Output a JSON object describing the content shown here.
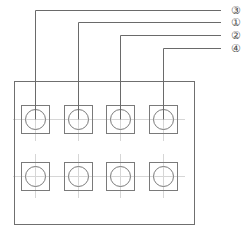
{
  "diagram": {
    "canvas": {
      "width": 249,
      "height": 232
    },
    "line_color": "#6f6f6f",
    "module_color": "#7a7a7a",
    "centerline_color": "#d6d6d6",
    "label_color": "#4a4a4a",
    "background_color": "#ffffff"
  },
  "enclosure": {
    "name": "outer housing panel",
    "x": 14,
    "y": 81,
    "width": 180,
    "height": 143
  },
  "modules": {
    "rows": 2,
    "columns": 4,
    "square_size": 28,
    "circle_diameter": 20,
    "column_pitch": 43,
    "row_pitch": 57,
    "first_column_x": 21,
    "row_y": [
      105,
      162
    ],
    "items": [
      {
        "row": 1,
        "column": 1,
        "cx": 35,
        "cy": 119
      },
      {
        "row": 1,
        "column": 2,
        "cx": 78,
        "cy": 119
      },
      {
        "row": 1,
        "column": 3,
        "cx": 120,
        "cy": 119
      },
      {
        "row": 1,
        "column": 4,
        "cx": 163,
        "cy": 119
      },
      {
        "row": 2,
        "column": 1,
        "cx": 35,
        "cy": 176
      },
      {
        "row": 2,
        "column": 2,
        "cx": 78,
        "cy": 176
      },
      {
        "row": 2,
        "column": 3,
        "cx": 120,
        "cy": 176
      },
      {
        "row": 2,
        "column": 4,
        "cx": 163,
        "cy": 176
      }
    ]
  },
  "callouts": [
    {
      "label": "③",
      "number": "3",
      "name": "callout-3",
      "horizontal_y": 10,
      "bend_x": 35,
      "drop_to_y": 119,
      "line_end_x": 221,
      "label_x": 228,
      "label_y": 10
    },
    {
      "label": "①",
      "number": "1",
      "name": "callout-1",
      "horizontal_y": 22,
      "bend_x": 78,
      "drop_to_y": 119,
      "line_end_x": 221,
      "label_x": 228,
      "label_y": 22
    },
    {
      "label": "②",
      "number": "2",
      "name": "callout-2",
      "horizontal_y": 35,
      "bend_x": 120,
      "drop_to_y": 119,
      "line_end_x": 221,
      "label_x": 228,
      "label_y": 35
    },
    {
      "label": "④",
      "number": "4",
      "name": "callout-4",
      "horizontal_y": 48,
      "bend_x": 163,
      "drop_to_y": 119,
      "line_end_x": 221,
      "label_x": 228,
      "label_y": 48
    }
  ]
}
